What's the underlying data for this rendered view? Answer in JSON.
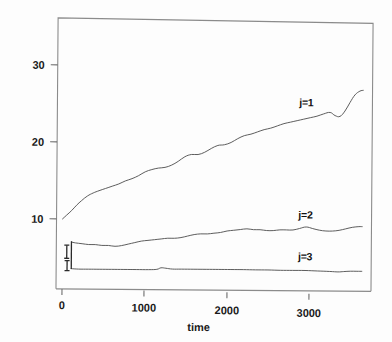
{
  "chart_data": {
    "type": "line",
    "title": "",
    "subtitle": "",
    "xlabel": "time",
    "ylabel": "",
    "xlim": [
      0,
      3650
    ],
    "ylim": [
      0,
      36
    ],
    "grid": false,
    "legend_position": "inline-right",
    "xticks": [
      0,
      1000,
      2000,
      3000
    ],
    "xtick_labels": [
      "0",
      "1000",
      "2000",
      "3000"
    ],
    "yticks": [
      10,
      20,
      30
    ],
    "ytick_labels": [
      "10",
      "20",
      "30"
    ],
    "series": [
      {
        "name": "j=1",
        "label": "j=1",
        "label_x": 2950,
        "label_y": 24.9,
        "x": [
          0,
          50,
          110,
          170,
          230,
          300,
          370,
          440,
          520,
          600,
          680,
          760,
          840,
          920,
          1000,
          1080,
          1160,
          1240,
          1320,
          1400,
          1480,
          1560,
          1640,
          1720,
          1800,
          1880,
          1960,
          2040,
          2120,
          2200,
          2280,
          2360,
          2440,
          2520,
          2600,
          2680,
          2760,
          2840,
          2920,
          3000,
          3080,
          3160,
          3240,
          3300,
          3360,
          3420,
          3480,
          3540,
          3600,
          3640
        ],
        "y": [
          10.0,
          10.5,
          11.1,
          11.8,
          12.4,
          13.0,
          13.4,
          13.7,
          14.0,
          14.3,
          14.6,
          15.0,
          15.3,
          15.7,
          16.2,
          16.5,
          16.7,
          16.8,
          17.1,
          17.6,
          18.2,
          18.5,
          18.5,
          18.8,
          19.3,
          19.7,
          19.8,
          20.1,
          20.6,
          21.0,
          21.2,
          21.5,
          21.8,
          22.0,
          22.3,
          22.6,
          22.8,
          23.0,
          23.2,
          23.4,
          23.6,
          23.9,
          24.1,
          23.7,
          23.6,
          24.3,
          25.4,
          26.4,
          26.9,
          27.0
        ]
      },
      {
        "name": "j=2",
        "label": "j=2",
        "label_x": 2950,
        "label_y": 10.3,
        "x": [
          110,
          160,
          240,
          320,
          400,
          480,
          560,
          640,
          720,
          800,
          880,
          960,
          1040,
          1120,
          1200,
          1280,
          1360,
          1440,
          1520,
          1600,
          1680,
          1760,
          1840,
          1920,
          2000,
          2080,
          2160,
          2240,
          2320,
          2400,
          2480,
          2560,
          2640,
          2720,
          2800,
          2880,
          2960,
          3040,
          3120,
          3200,
          3280,
          3360,
          3440,
          3520,
          3600,
          3640
        ],
        "y": [
          7.0,
          6.9,
          6.8,
          6.7,
          6.7,
          6.6,
          6.6,
          6.5,
          6.6,
          6.8,
          7.0,
          7.2,
          7.3,
          7.4,
          7.5,
          7.6,
          7.6,
          7.7,
          7.9,
          8.1,
          8.2,
          8.2,
          8.3,
          8.4,
          8.6,
          8.7,
          8.8,
          8.9,
          8.8,
          8.8,
          8.7,
          8.7,
          8.8,
          8.8,
          8.8,
          9.0,
          9.2,
          9.0,
          8.8,
          8.7,
          8.7,
          8.8,
          9.0,
          9.2,
          9.3,
          9.3
        ]
      },
      {
        "name": "j=3",
        "label": "j=3",
        "label_x": 2950,
        "label_y": 4.9,
        "x": [
          110,
          200,
          320,
          450,
          600,
          750,
          900,
          1050,
          1150,
          1200,
          1260,
          1340,
          1450,
          1600,
          1750,
          1900,
          2050,
          2200,
          2350,
          2500,
          2650,
          2800,
          2950,
          3100,
          3250,
          3350,
          3420,
          3500,
          3580,
          3640
        ],
        "y": [
          3.55,
          3.5,
          3.5,
          3.5,
          3.5,
          3.5,
          3.5,
          3.5,
          3.55,
          3.75,
          3.7,
          3.6,
          3.6,
          3.6,
          3.6,
          3.6,
          3.6,
          3.6,
          3.58,
          3.58,
          3.55,
          3.55,
          3.55,
          3.5,
          3.45,
          3.4,
          3.45,
          3.5,
          3.5,
          3.5
        ]
      }
    ],
    "artifacts": [
      {
        "name": "initial-transient-bracket-upper",
        "x": 55,
        "y_top": 6.6,
        "y_bottom": 4.9
      },
      {
        "name": "initial-transient-bracket-lower",
        "x": 60,
        "y_top": 4.6,
        "y_bottom": 3.3
      },
      {
        "name": "initial-vertical-drop",
        "x": 110,
        "y_top": 7.1,
        "y_bottom": 3.5
      }
    ]
  },
  "axis": {
    "x_title": "time",
    "y_title": ""
  }
}
